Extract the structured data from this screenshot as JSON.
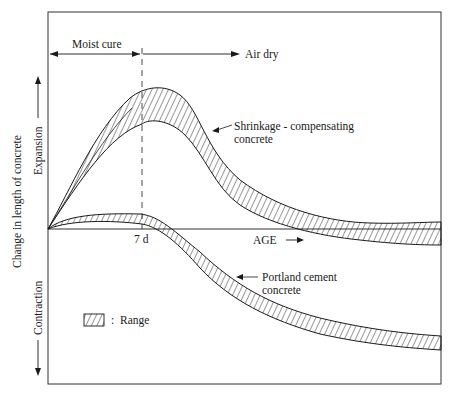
{
  "diagram": {
    "type": "line-band-diagram",
    "y_axis": {
      "label": "Change in length of concrete",
      "up_label": "Expansion",
      "down_label": "Contraction"
    },
    "x_axis": {
      "label": "AGE",
      "tick_label": "7 d"
    },
    "phases": {
      "moist_cure": "Moist cure",
      "air_dry": "Air dry"
    },
    "curves": [
      {
        "name": "Shrinkage - compensating concrete",
        "line1": "Shrinkage - compensating",
        "line2": "concrete"
      },
      {
        "name": "Portland cement concrete",
        "line1": "Portland cement",
        "line2": "concrete"
      }
    ],
    "legend": {
      "symbol": "hatched-box",
      "separator": ":",
      "label": "Range"
    },
    "colors": {
      "ink": "#1a1a1a",
      "background": "#ffffff"
    }
  }
}
